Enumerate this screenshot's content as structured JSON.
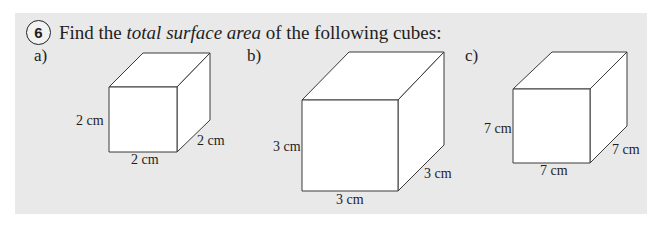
{
  "question": {
    "number": "6",
    "prompt_before": "Find the ",
    "prompt_emphasis": "total surface area",
    "prompt_after": " of the following cubes:"
  },
  "cubes": [
    {
      "label": "a)",
      "edge_label": "2 cm",
      "labels": {
        "height": "2 cm",
        "width": "2 cm",
        "depth": "2 cm"
      }
    },
    {
      "label": "b)",
      "edge_label": "3 cm",
      "labels": {
        "height": "3 cm",
        "width": "3 cm",
        "depth": "3 cm"
      }
    },
    {
      "label": "c)",
      "edge_label": "7 cm",
      "labels": {
        "height": "7 cm",
        "width": "7 cm",
        "depth": "7 cm"
      }
    }
  ],
  "colors": {
    "panel_background": "#e9e9e9",
    "face_fill": "#ffffff",
    "line": "#3a3a3a",
    "text": "#1e1e1e"
  }
}
